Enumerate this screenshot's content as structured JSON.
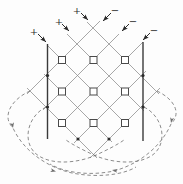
{
  "diagram": {
    "name": "diode-lattice-matrix-with-return-loops",
    "canvas": {
      "width": 183,
      "height": 184,
      "background": "#fdfdfd"
    },
    "colors": {
      "lattice": "#898989",
      "bus": "#3a3a3a",
      "dashed": "#6f6f6f",
      "symbol": "#2b2b2b",
      "node_fill": "#ffffff",
      "node_stroke": "#4a4a4a"
    },
    "polarity_labels": [
      {
        "text": "+",
        "x": 34,
        "y": 31
      },
      {
        "text": "+",
        "x": 59,
        "y": 21
      },
      {
        "text": "+",
        "x": 77,
        "y": 10
      },
      {
        "text": "−",
        "x": 115,
        "y": 10
      },
      {
        "text": "−",
        "x": 133,
        "y": 21
      },
      {
        "text": "−",
        "x": 154,
        "y": 30
      }
    ],
    "input_arrows": [
      {
        "x1": 38,
        "y1": 34,
        "x2": 46,
        "y2": 42
      },
      {
        "x1": 62,
        "y1": 24,
        "x2": 69,
        "y2": 31
      },
      {
        "x1": 81,
        "y1": 13,
        "x2": 88,
        "y2": 20
      },
      {
        "x1": 111,
        "y1": 13,
        "x2": 103,
        "y2": 21
      },
      {
        "x1": 129,
        "y1": 24,
        "x2": 122,
        "y2": 31
      },
      {
        "x1": 150,
        "y1": 33,
        "x2": 143,
        "y2": 40
      }
    ],
    "lattice_lines": [
      {
        "x1": 87,
        "y1": 22,
        "x2": 159,
        "y2": 94
      },
      {
        "x1": 67,
        "y1": 34,
        "x2": 144,
        "y2": 111
      },
      {
        "x1": 47,
        "y1": 45,
        "x2": 128,
        "y2": 126
      },
      {
        "x1": 44,
        "y1": 74,
        "x2": 112,
        "y2": 142
      },
      {
        "x1": 27,
        "y1": 88,
        "x2": 97,
        "y2": 158
      },
      {
        "x1": 100,
        "y1": 21,
        "x2": 27,
        "y2": 94
      },
      {
        "x1": 119,
        "y1": 34,
        "x2": 43,
        "y2": 110
      },
      {
        "x1": 143,
        "y1": 42,
        "x2": 58,
        "y2": 127
      },
      {
        "x1": 146,
        "y1": 71,
        "x2": 74,
        "y2": 143
      },
      {
        "x1": 160,
        "y1": 88,
        "x2": 90,
        "y2": 158
      }
    ],
    "bus_lines": [
      {
        "x1": 47.5,
        "y1": 44,
        "x2": 47.5,
        "y2": 139
      },
      {
        "x1": 143,
        "y1": 42,
        "x2": 143,
        "y2": 141
      }
    ],
    "node_squares": {
      "size": 7,
      "centers": [
        [
          62,
          60
        ],
        [
          93.5,
          60
        ],
        [
          125,
          60
        ],
        [
          62,
          91.5
        ],
        [
          93.5,
          91.5
        ],
        [
          125,
          91.5
        ],
        [
          62,
          123
        ],
        [
          93.5,
          123
        ],
        [
          125,
          123
        ]
      ]
    },
    "junction_dots": [
      [
        47.5,
        75.5
      ],
      [
        47.5,
        107
      ],
      [
        143,
        75.5
      ],
      [
        143,
        107
      ],
      [
        78,
        139
      ],
      [
        109,
        139
      ]
    ],
    "dashed_curves": [
      {
        "path": "M 30 91 C 12 99 1 116 13 128 C 23 150 46 167 72 173 C 97 178 123 175 136 167",
        "arrows": [
          {
            "x": 13,
            "y": 128,
            "angle": 80
          },
          {
            "x": 56,
            "y": 171.5,
            "angle": 14
          }
        ]
      },
      {
        "path": "M 157 91 C 174 99 182 113 171 124 C 161 147 139 164 114 171 C 90 176 65 173 50 164",
        "arrows": [
          {
            "x": 171,
            "y": 123,
            "angle": 102
          },
          {
            "x": 112,
            "y": 170,
            "angle": 189
          }
        ]
      },
      {
        "path": "M 46 107 C 28 116 22 140 35 153 C 48 165 74 164 94 156 C 107 150 117 145 124 140",
        "arrows": []
      },
      {
        "path": "M 144 107 C 162 116 168 140 155 153 C 142 165 116 164 96 156 C 83 150 73 145 66 140",
        "arrows": []
      }
    ]
  }
}
